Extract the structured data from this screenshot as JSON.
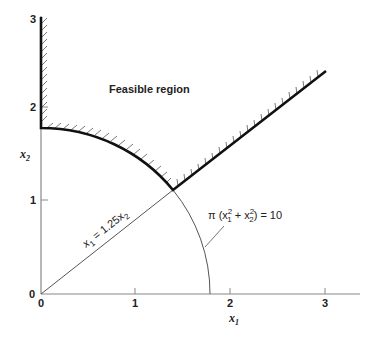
{
  "diagram": {
    "region_label": "Feasible region",
    "x_axis": {
      "label": "x",
      "label_sub": "1",
      "ticks": [
        "0",
        "1",
        "2",
        "3"
      ]
    },
    "y_axis": {
      "label": "x",
      "label_sub": "2",
      "ticks": [
        "0",
        "1",
        "2",
        "3"
      ]
    },
    "line_label": {
      "pre": "x",
      "sub1": "1",
      "mid": " = 1.25x",
      "sub2": "2"
    },
    "circle_label": {
      "pre": "π (x",
      "sub1": "1",
      "sup1": "2",
      "mid": " + x",
      "sub2": "2",
      "sup2": "2",
      "post": ") = 10"
    }
  },
  "colors": {
    "boundary": "#111111",
    "axis": "#777777",
    "hatch": "#555555"
  }
}
